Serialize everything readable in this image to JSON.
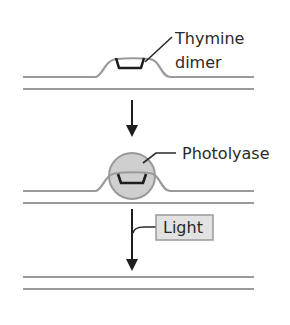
{
  "stages": [
    {
      "name": "damaged-dna",
      "label_lines": [
        "Thymine",
        "dimer"
      ]
    },
    {
      "name": "enzyme-bound",
      "label": "Photolyase"
    },
    {
      "name": "repaired-dna"
    }
  ],
  "step_label": "Light",
  "colors": {
    "strand": "#9a9a9a",
    "dimer": "#1e1e1e",
    "enzyme_fill": "#cfcfcf",
    "enzyme_stroke": "#9a9a9a",
    "light_box_fill": "#e2e2e2",
    "light_box_stroke": "#9a9a9a"
  }
}
